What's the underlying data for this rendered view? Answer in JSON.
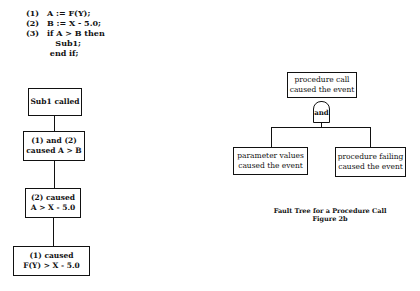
{
  "code_listing": {
    "lines": [
      {
        "num": "(1)",
        "text": "A := F(Y);"
      },
      {
        "num": "(2)",
        "text": "B := X - 5.0;"
      },
      {
        "num": "(3)",
        "text": "if A > B then"
      },
      {
        "num": "",
        "text": "   Sub1;"
      },
      {
        "num": "",
        "text": " end if;"
      }
    ]
  },
  "left_chain": {
    "nodes": [
      {
        "line1": "Sub1 called",
        "line2": ""
      },
      {
        "line1": "(1) and (2)",
        "line2": "caused A > B"
      },
      {
        "line1": "(2) caused",
        "line2": "A > X - 5.0"
      },
      {
        "line1": "(1) caused",
        "line2": "F(Y) > X - 5.0"
      }
    ]
  },
  "fault_tree": {
    "top_event": {
      "line1": "procedure call",
      "line2": "caused the event"
    },
    "gate_label": "and",
    "children": [
      {
        "line1": "parameter values",
        "line2": "caused the event"
      },
      {
        "line1": "procedure failing",
        "line2": "caused the event"
      }
    ],
    "caption": {
      "title": "Fault Tree for a Procedure Call",
      "figure": "Figure 2b"
    }
  }
}
